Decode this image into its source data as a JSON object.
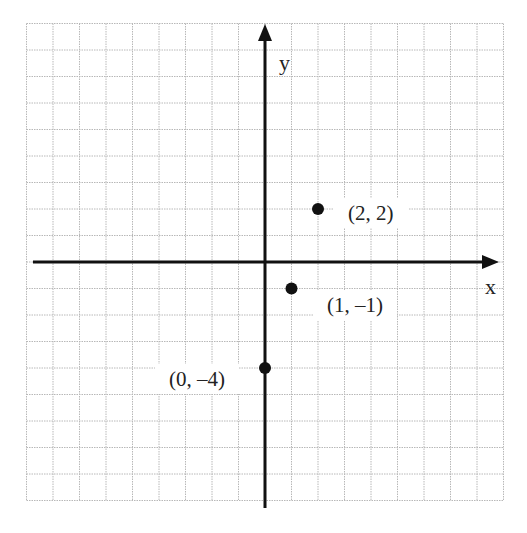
{
  "chart_data": {
    "type": "scatter",
    "title": "",
    "xlabel": "x",
    "ylabel": "y",
    "grid": true,
    "grid_style": "dotted light gray",
    "xlim": [
      -9,
      9
    ],
    "ylim": [
      -9,
      9
    ],
    "points": [
      {
        "x": 2,
        "y": 2,
        "label": "(2, 2)"
      },
      {
        "x": 1,
        "y": -1,
        "label": "(1, –1)"
      },
      {
        "x": 0,
        "y": -4,
        "label": "(0, –4)"
      }
    ],
    "colors": {
      "grid": "#b8b8b8",
      "axis": "#111111",
      "point": "#111111",
      "text": "#222222"
    }
  },
  "labels": {
    "x_axis": "x",
    "y_axis": "y",
    "p1": "(2, 2)",
    "p2": "(1, –1)",
    "p3": "(0, –4)"
  }
}
